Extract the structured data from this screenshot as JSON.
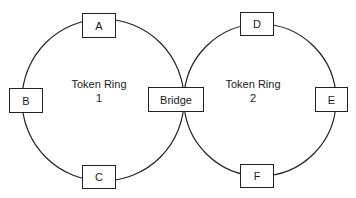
{
  "diagram": {
    "type": "token-ring-network",
    "colors": {
      "line": "#222222",
      "background": "#ffffff",
      "text": "#1a1a1a"
    },
    "rings": [
      {
        "id": "ring1",
        "title": "Token Ring",
        "number": "1",
        "nodes": [
          "A",
          "B",
          "C"
        ]
      },
      {
        "id": "ring2",
        "title": "Token Ring",
        "number": "2",
        "nodes": [
          "D",
          "E",
          "F"
        ]
      }
    ],
    "nodes": {
      "a": "A",
      "b": "B",
      "c": "C",
      "d": "D",
      "e": "E",
      "f": "F",
      "bridge": "Bridge"
    },
    "connections": [
      {
        "from": "ring1",
        "to": "ring2",
        "via": "Bridge"
      }
    ]
  }
}
